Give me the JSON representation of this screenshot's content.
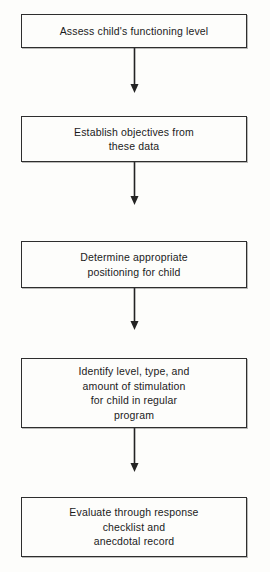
{
  "diagram": {
    "type": "flowchart",
    "orientation": "vertical",
    "title": "",
    "background_color": "#fdfdfb",
    "line_color": "#232323",
    "box_border_color": "#2e2e2e",
    "text_color": "#1b1b1b",
    "nodes": [
      {
        "id": "node-1",
        "label": "Assess child's functioning level",
        "lines": [
          "Assess child's functioning level"
        ],
        "shape": "rectangle"
      },
      {
        "id": "node-2",
        "label": "Establish objectives from these data",
        "lines": [
          "Establish objectives from",
          "these data"
        ],
        "shape": "rectangle"
      },
      {
        "id": "node-3",
        "label": "Determine appropriate positioning for child",
        "lines": [
          "Determine appropriate",
          "positioning for child"
        ],
        "shape": "rectangle"
      },
      {
        "id": "node-4",
        "label": "Identify level, type, and amount of stimulation for child in regular program",
        "lines": [
          "Identify level, type, and",
          "amount of stimulation",
          "for child in regular",
          "program"
        ],
        "shape": "rectangle"
      },
      {
        "id": "node-5",
        "label": "Evaluate through response checklist and anecdotal record",
        "lines": [
          "Evaluate through response",
          "checklist and",
          "anecdotal record"
        ],
        "shape": "rectangle"
      }
    ],
    "edges": [
      {
        "id": "edge-1",
        "from": "node-1",
        "to": "node-2",
        "style": "arrow",
        "label": ""
      },
      {
        "id": "edge-2",
        "from": "node-2",
        "to": "node-3",
        "style": "arrow",
        "label": ""
      },
      {
        "id": "edge-3",
        "from": "node-3",
        "to": "node-4",
        "style": "arrow",
        "label": ""
      },
      {
        "id": "edge-4",
        "from": "node-4",
        "to": "node-5",
        "style": "arrow",
        "label": ""
      }
    ]
  }
}
